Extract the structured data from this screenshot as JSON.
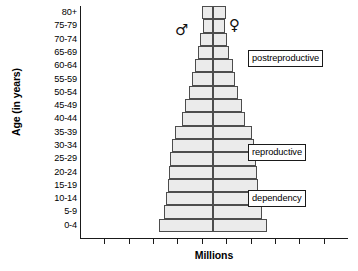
{
  "chart_data": {
    "type": "bar",
    "subtype": "population-pyramid",
    "title": "",
    "xlabel": "Millions",
    "ylabel": "Age (in years)",
    "grid": false,
    "legend_position": "inline-symbols",
    "orientation": "horizontal-diverging",
    "axis_tick_labels": [],
    "x_tick_count": 10,
    "categories": [
      "80+",
      "75-79",
      "70-74",
      "65-69",
      "60-64",
      "55-59",
      "50-54",
      "45-49",
      "40-44",
      "35-39",
      "30-34",
      "25-29",
      "20-24",
      "15-19",
      "10-14",
      "5-9",
      "0-4"
    ],
    "series": [
      {
        "name": "male",
        "symbol": "♂",
        "side": "left",
        "values": [
          10,
          9,
          11,
          13,
          16,
          18,
          21,
          24,
          27,
          33,
          36,
          37,
          38,
          39,
          41,
          43,
          47
        ]
      },
      {
        "name": "female",
        "symbol": "♀",
        "side": "right",
        "values": [
          11,
          10,
          12,
          14,
          17,
          19,
          22,
          25,
          28,
          34,
          36,
          37,
          38,
          39,
          41,
          43,
          47
        ]
      }
    ],
    "annotations": [
      {
        "label": "postreproductive",
        "spans": "65-69 to 80+"
      },
      {
        "label": "reproductive",
        "spans": "15-19 to 45-49"
      },
      {
        "label": "dependency",
        "spans": "0-4 to 10-14"
      }
    ]
  },
  "axes": {
    "y_title": "Age (in years)",
    "x_title": "Millions"
  },
  "symbols": {
    "male": "♂",
    "female": "♀"
  },
  "colors": {
    "bar_fill": "#ebebeb",
    "bar_stroke": "#4d4d4d",
    "axis": "#1a1a1a",
    "text": "#000000"
  }
}
